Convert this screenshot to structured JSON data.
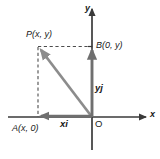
{
  "figure": {
    "type": "diagram",
    "canvas": {
      "width": 160,
      "height": 159
    },
    "background_color": "#ffffff",
    "colors": {
      "axis": "#3a3a3a",
      "vector_resultant": "#8c8c8c",
      "vector_component": "#6f6f6f",
      "dashed_guide": "#4d4d4d",
      "text": "#1a1a1a"
    },
    "labels": {
      "point_P": "P(x, y)",
      "point_B": "B(0, y)",
      "point_A": "A(x, 0)",
      "component_x": "xi",
      "component_y": "yj",
      "axis_x": "x",
      "axis_y": "y",
      "origin": "O"
    },
    "geometry": {
      "origin_px": {
        "x": 92,
        "y": 117
      },
      "point_P_px": {
        "x": 38,
        "y": 47
      },
      "point_A_px": {
        "x": 38,
        "y": 117
      },
      "point_B_px": {
        "x": 92,
        "y": 47
      },
      "x_axis_span_px": [
        8,
        146
      ],
      "y_axis_span_px": [
        8,
        150
      ],
      "quadrant_of_P": "second"
    },
    "elements": [
      {
        "name": "x-axis",
        "style": "solid arrow right"
      },
      {
        "name": "y-axis",
        "style": "solid arrow up"
      },
      {
        "name": "vector-OP",
        "style": "thick gray arrow from O to P"
      },
      {
        "name": "vector-xi",
        "style": "thick gray arrow from O to A along negative x"
      },
      {
        "name": "vector-yj",
        "style": "thick gray arrow from O to B along positive y"
      },
      {
        "name": "guide-PA",
        "style": "vertical dashed from P down to A"
      },
      {
        "name": "guide-PB",
        "style": "horizontal dashed from P right to B"
      }
    ]
  }
}
